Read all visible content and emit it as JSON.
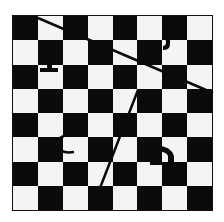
{
  "board": {
    "rows": 8,
    "cols": 8,
    "top_left_color": "dark",
    "colors": {
      "dark": "#0a0a0a",
      "light": "#f4f4f4",
      "line": "#0a0a0a"
    }
  },
  "glyphs": [
    {
      "name": "glyph-a",
      "col": 1,
      "row": 2,
      "shape": "t-bar"
    },
    {
      "name": "glyph-b",
      "col": 6,
      "row": 0,
      "shape": "hook"
    },
    {
      "name": "glyph-c",
      "col": 2,
      "row": 5,
      "shape": "curl"
    },
    {
      "name": "glyph-d",
      "col": 6,
      "row": 5,
      "shape": "arch"
    }
  ],
  "lines": [
    {
      "name": "diagonal-line-1",
      "x1": 38,
      "y1": 18,
      "x2": 213,
      "y2": 93
    },
    {
      "name": "diagonal-line-2",
      "x1": 138,
      "y1": 90,
      "x2": 100,
      "y2": 188
    }
  ]
}
